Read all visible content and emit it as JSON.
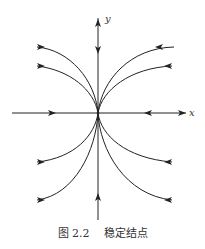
{
  "figure": {
    "title": "稳定结点",
    "number": "图 2.2",
    "axes": {
      "x_label": "x",
      "y_label": "y"
    },
    "stroke_color": "#222222",
    "background": "#ffffff"
  },
  "caption": {
    "number": "图 2.2",
    "text": "稳定结点"
  }
}
